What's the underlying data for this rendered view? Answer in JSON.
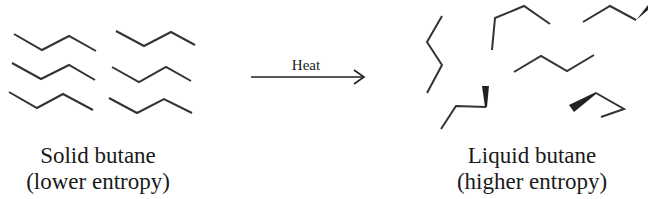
{
  "process": {
    "arrow_label": "Heat"
  },
  "solid": {
    "caption_line1": "Solid butane",
    "caption_line2": "(lower entropy)",
    "molecule_count": 6
  },
  "liquid": {
    "caption_line1": "Liquid butane",
    "caption_line2": "(higher entropy)",
    "molecule_count": 7
  },
  "colors": {
    "bond": "#333333",
    "text": "#1a1a1a",
    "background": "#ffffff"
  }
}
